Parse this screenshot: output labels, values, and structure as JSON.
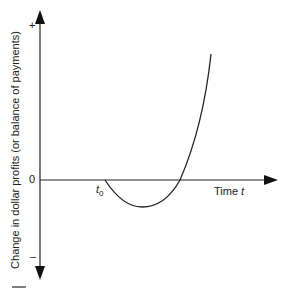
{
  "diagram": {
    "type": "J-curve",
    "y_axis_label": "Change in dollar profits (or balance of payments)",
    "x_axis_label": "Time",
    "x_axis_var": "t",
    "y_plus": "+",
    "y_zero": "0",
    "y_minus": "–",
    "t0_label": "t",
    "t0_sub": "0",
    "colors": {
      "line": "#222222",
      "background": "#ffffff"
    }
  }
}
